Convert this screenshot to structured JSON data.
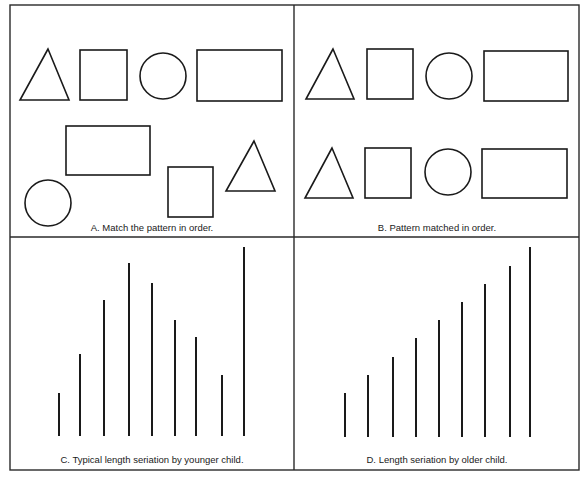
{
  "figure": {
    "panels": [
      {
        "id": "A",
        "caption": "A.  Match the pattern in order.",
        "shapes": [
          {
            "type": "triangle",
            "points": "48,49 20,100 69,100"
          },
          {
            "type": "square",
            "x": 80,
            "y": 50,
            "w": 47,
            "h": 50
          },
          {
            "type": "circle",
            "cx": 163,
            "cy": 76,
            "r": 23
          },
          {
            "type": "rectangle",
            "x": 197,
            "y": 50,
            "w": 85,
            "h": 51
          },
          {
            "type": "rectangle",
            "x": 66,
            "y": 126,
            "w": 84,
            "h": 49
          },
          {
            "type": "circle",
            "cx": 48,
            "cy": 203,
            "r": 23
          },
          {
            "type": "square",
            "x": 168,
            "y": 167,
            "w": 45,
            "h": 50
          },
          {
            "type": "triangle",
            "points": "254,141 226,191 275,191"
          }
        ]
      },
      {
        "id": "B",
        "caption": "B.  Pattern matched in order.",
        "shapes": [
          {
            "type": "triangle",
            "points": "333,49 306,99 354,99"
          },
          {
            "type": "square",
            "x": 367,
            "y": 49,
            "w": 46,
            "h": 50
          },
          {
            "type": "circle",
            "cx": 449,
            "cy": 76,
            "r": 23
          },
          {
            "type": "rectangle",
            "x": 484,
            "y": 51,
            "w": 84,
            "h": 50
          },
          {
            "type": "triangle",
            "points": "332,148 305,198 353,198"
          },
          {
            "type": "square",
            "x": 365,
            "y": 148,
            "w": 46,
            "h": 50
          },
          {
            "type": "circle",
            "cx": 448,
            "cy": 172,
            "r": 23
          },
          {
            "type": "rectangle",
            "x": 482,
            "y": 149,
            "w": 85,
            "h": 49
          }
        ]
      },
      {
        "id": "C",
        "caption": "C.  Typical length seriation by younger child.",
        "bars": [
          {
            "x": 59,
            "top": 393
          },
          {
            "x": 80,
            "top": 354
          },
          {
            "x": 104,
            "top": 300
          },
          {
            "x": 129,
            "top": 263
          },
          {
            "x": 152,
            "top": 283
          },
          {
            "x": 175,
            "top": 320
          },
          {
            "x": 196,
            "top": 337
          },
          {
            "x": 222,
            "top": 375
          },
          {
            "x": 244,
            "top": 247
          }
        ],
        "baseline": 436
      },
      {
        "id": "D",
        "caption": "D.  Length seriation by older child.",
        "bars": [
          {
            "x": 345,
            "top": 393
          },
          {
            "x": 368,
            "top": 375
          },
          {
            "x": 393,
            "top": 357
          },
          {
            "x": 416,
            "top": 338
          },
          {
            "x": 439,
            "top": 320
          },
          {
            "x": 462,
            "top": 302
          },
          {
            "x": 485,
            "top": 284
          },
          {
            "x": 510,
            "top": 266
          },
          {
            "x": 530,
            "top": 247
          }
        ],
        "baseline": 437
      }
    ]
  }
}
